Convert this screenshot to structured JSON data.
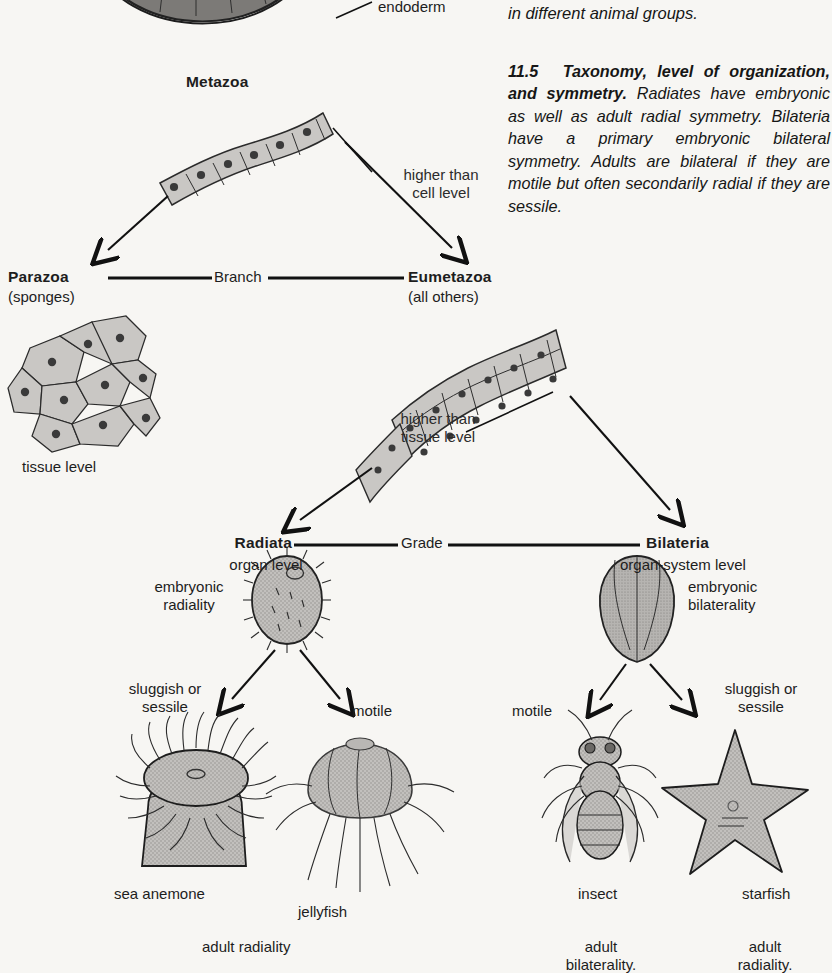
{
  "figure": {
    "number": "11.5",
    "title": "Taxonomy, level of organization, and symmetry.",
    "caption_continued_top": "in different animal groups.",
    "caption_body": "Radiates have embryonic as well as adult radial symmetry. Bilateria have a primary embryonic bilateral symmetry. Adults are bilateral if they are motile but often secondarily radial if they are sessile."
  },
  "labels": {
    "endoderm": "endoderm",
    "metazoa": "Metazoa",
    "higher_than_cell_level": "higher than\ncell level",
    "parazoa": "Parazoa",
    "parazoa_sub": "(sponges)",
    "branch": "Branch",
    "eumetazoa": "Eumetazoa",
    "eumetazoa_sub": "(all others)",
    "tissue_level": "tissue level",
    "higher_than_tissue_level": "higher than\ntissue level",
    "radiata": "Radiata",
    "radiata_sub": "organ level",
    "grade": "Grade",
    "bilateria": "Bilateria",
    "bilateria_sub": "organ-system level",
    "embryonic_radiality": "embryonic\nradiality",
    "embryonic_bilaterality": "embryonic\nbilaterality",
    "sluggish_or_sessile_left": "sluggish or\nsessile",
    "motile_left": "motile",
    "motile_right": "motile",
    "sluggish_or_sessile_right": "sluggish or\nsessile",
    "sea_anemone": "sea anemone",
    "jellyfish": "jellyfish",
    "insect": "insect",
    "starfish": "starfish",
    "adult_radiality_left": "adult radiality",
    "adult_bilaterality": "adult\nbilaterality.",
    "adult_radiality_right": "adult\nradiality."
  },
  "colors": {
    "page_background": "#f7f6f3",
    "ink": "#1a1a1a",
    "cell_fill": "#c9c7c4",
    "organism_fill": "#bdbbb8",
    "dark_tissue": "#8d8b88"
  }
}
